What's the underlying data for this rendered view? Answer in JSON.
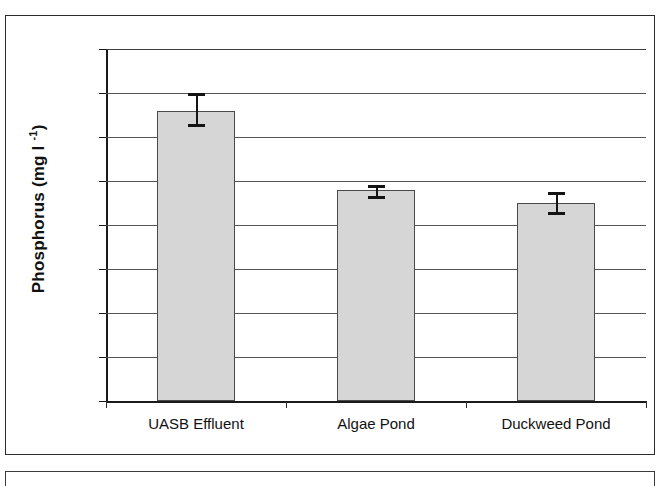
{
  "chart_data": {
    "type": "bar",
    "title": "",
    "xlabel": "",
    "ylabel": "Phosphorus (mg l -1)",
    "ylabel_base": "Phosphorus (mg l ",
    "ylabel_sup": "-1",
    "ylabel_tail": ")",
    "categories": [
      "UASB Effluent",
      "Algae Pond",
      "Duckweed Pond"
    ],
    "values": [
      6.6,
      4.8,
      4.5
    ],
    "error_low": [
      6.3,
      4.65,
      4.3
    ],
    "error_high": [
      7.0,
      4.9,
      4.75
    ],
    "error_minus": [
      0.3,
      0.15,
      0.2
    ],
    "error_plus": [
      0.4,
      0.1,
      0.25
    ],
    "ylim": [
      0.0,
      8.0
    ],
    "ytick_step": 1.0,
    "ytick_labels": [
      "8.0",
      "7.0",
      "6.0",
      "5.0",
      "4.0",
      "3.0",
      "2.0",
      "1.0",
      "0.0"
    ],
    "ytick_values": [
      8.0,
      7.0,
      6.0,
      5.0,
      4.0,
      3.0,
      2.0,
      1.0,
      0.0
    ],
    "grid": true,
    "legend": false,
    "legend_position": "none",
    "bar_fill_color": "#d6d6d6",
    "bar_border_color": "#4a4a4a",
    "error_bar_color": "#141414",
    "axis_color": "#1a1a1a",
    "gridline_color": "#555555",
    "background_color": "#ffffff"
  },
  "figure": {
    "frame_visible": true,
    "lower_frame_visible": true
  }
}
